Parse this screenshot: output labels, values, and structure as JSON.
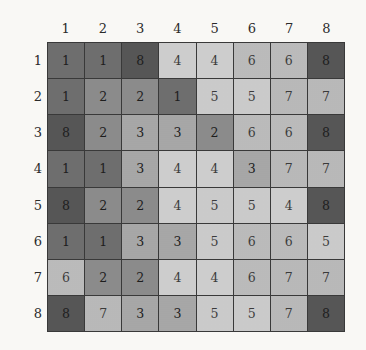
{
  "figure": {
    "name": "matrix-heatmap",
    "rows": 8,
    "cols": 8
  },
  "axes": {
    "column_labels": [
      "1",
      "2",
      "3",
      "4",
      "5",
      "6",
      "7",
      "8"
    ],
    "row_labels": [
      "1",
      "2",
      "3",
      "4",
      "5",
      "6",
      "7",
      "8"
    ]
  },
  "palette": {
    "background": "#fbfaf7",
    "gridline": "#3a3a3a",
    "value_1": "#6f6f6f",
    "value_2": "#8c8c8c",
    "value_3": "#a8a8a8",
    "value_4": "#cfcfcf",
    "value_5": "#cccccc",
    "value_6": "#bcbcbc",
    "value_7": "#bababa",
    "value_8": "#575757"
  },
  "chart_data": {
    "type": "heatmap",
    "title": "",
    "xlabel": "",
    "ylabel": "",
    "categories": [
      "1",
      "2",
      "3",
      "4",
      "5",
      "6",
      "7",
      "8"
    ],
    "row_categories": [
      "1",
      "2",
      "3",
      "4",
      "5",
      "6",
      "7",
      "8"
    ],
    "grid": true,
    "legend": "none",
    "value_range": [
      1,
      8
    ],
    "colorscale": "grayscale-discrete",
    "cell_labels": true,
    "values": [
      [
        1,
        1,
        8,
        4,
        4,
        6,
        6,
        8
      ],
      [
        1,
        2,
        2,
        1,
        5,
        5,
        7,
        7
      ],
      [
        8,
        2,
        3,
        3,
        2,
        6,
        6,
        8
      ],
      [
        1,
        1,
        3,
        4,
        4,
        3,
        7,
        7
      ],
      [
        8,
        2,
        2,
        4,
        5,
        5,
        4,
        8
      ],
      [
        1,
        1,
        3,
        3,
        5,
        6,
        6,
        5
      ],
      [
        6,
        2,
        2,
        4,
        4,
        6,
        7,
        7
      ],
      [
        8,
        7,
        3,
        3,
        5,
        5,
        7,
        8
      ]
    ]
  }
}
